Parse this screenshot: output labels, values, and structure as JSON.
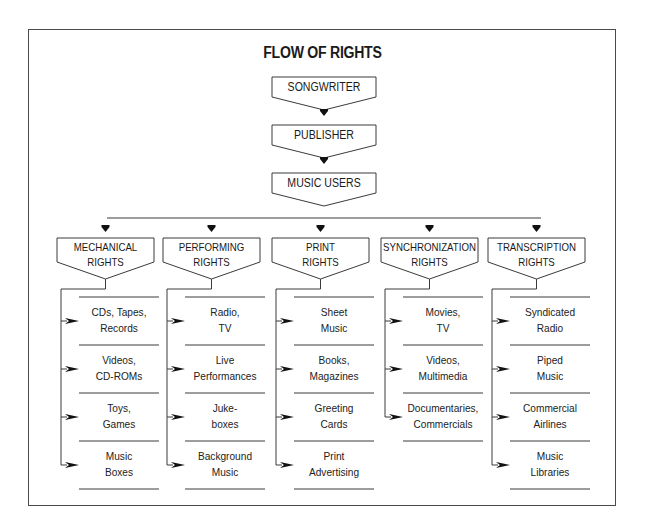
{
  "title": "FLOW OF RIGHTS",
  "chain": [
    {
      "label": "SONGWRITER"
    },
    {
      "label": "PUBLISHER"
    },
    {
      "label": "MUSIC USERS"
    }
  ],
  "categories": [
    {
      "label_line1": "MECHANICAL",
      "label_line2": "RIGHTS",
      "items": [
        {
          "line1": "CDs, Tapes,",
          "line2": "Records"
        },
        {
          "line1": "Videos,",
          "line2": "CD-ROMs"
        },
        {
          "line1": "Toys,",
          "line2": "Games"
        },
        {
          "line1": "Music",
          "line2": "Boxes"
        }
      ]
    },
    {
      "label_line1": "PERFORMING",
      "label_line2": "RIGHTS",
      "items": [
        {
          "line1": "Radio,",
          "line2": "TV"
        },
        {
          "line1": "Live",
          "line2": "Performances"
        },
        {
          "line1": "Juke-",
          "line2": "boxes"
        },
        {
          "line1": "Background",
          "line2": "Music"
        }
      ]
    },
    {
      "label_line1": "PRINT",
      "label_line2": "RIGHTS",
      "items": [
        {
          "line1": "Sheet",
          "line2": "Music"
        },
        {
          "line1": "Books,",
          "line2": "Magazines"
        },
        {
          "line1": "Greeting",
          "line2": "Cards"
        },
        {
          "line1": "Print",
          "line2": "Advertising"
        }
      ]
    },
    {
      "label_line1": "SYNCHRONIZATION",
      "label_line2": "RIGHTS",
      "items": [
        {
          "line1": "Movies,",
          "line2": "TV"
        },
        {
          "line1": "Videos,",
          "line2": "Multimedia"
        },
        {
          "line1": "Documentaries,",
          "line2": "Commercials"
        }
      ]
    },
    {
      "label_line1": "TRANSCRIPTION",
      "label_line2": "RIGHTS",
      "items": [
        {
          "line1": "Syndicated",
          "line2": "Radio"
        },
        {
          "line1": "Piped",
          "line2": "Music"
        },
        {
          "line1": "Commercial",
          "line2": "Airlines"
        },
        {
          "line1": "Music",
          "line2": "Libraries"
        }
      ]
    }
  ],
  "colors": {
    "line": "#3a3a3a",
    "text": "#1a1a1a",
    "background": "#ffffff"
  }
}
